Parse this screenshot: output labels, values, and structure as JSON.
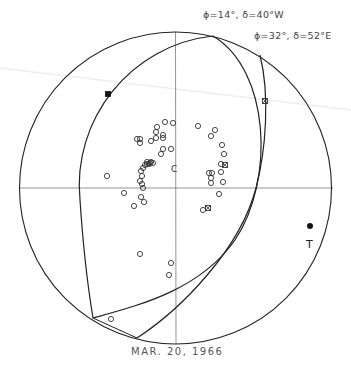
{
  "diagram": {
    "type": "stereographic-projection-focal-mechanism",
    "date_caption": "MAR. 20, 1966",
    "planes": [
      {
        "label": "ϕ=14°, δ=40°W",
        "phi": "14°",
        "delta": "40°W"
      },
      {
        "label": "ϕ=32°, δ=52°E",
        "phi": "32°",
        "delta": "52°E"
      }
    ],
    "axis_label": "T",
    "center_label": "C",
    "colors": {
      "line": "#222222",
      "axis": "#777777",
      "marker": "#333333",
      "background": "#ffffff"
    }
  },
  "chart_data": {
    "type": "scatter",
    "title": "MAR. 20, 1966",
    "primitive_circle": {
      "cx": 175.5,
      "cy": 188,
      "r": 156
    },
    "annotations": [
      "ϕ=14°, δ=40°W",
      "ϕ=32°, δ=52°E",
      "T",
      "C"
    ],
    "series": [
      {
        "name": "open-circles",
        "marker": "open-circle",
        "points": [
          [
            165,
            122
          ],
          [
            173,
            123
          ],
          [
            157,
            127
          ],
          [
            156,
            132
          ],
          [
            163,
            135
          ],
          [
            163,
            138
          ],
          [
            156,
            138
          ],
          [
            137,
            139
          ],
          [
            140,
            139
          ],
          [
            140,
            143
          ],
          [
            151,
            141
          ],
          [
            163,
            149
          ],
          [
            161,
            154
          ],
          [
            171,
            149
          ],
          [
            147,
            162
          ],
          [
            150,
            163
          ],
          [
            151,
            162
          ],
          [
            145,
            165
          ],
          [
            147,
            164
          ],
          [
            149,
            164
          ],
          [
            153,
            163
          ],
          [
            143,
            168
          ],
          [
            141,
            171
          ],
          [
            142,
            176
          ],
          [
            140,
            181
          ],
          [
            142,
            184
          ],
          [
            143,
            188
          ],
          [
            107,
            176
          ],
          [
            124,
            193
          ],
          [
            134,
            206
          ],
          [
            141,
            197
          ],
          [
            144,
            202
          ],
          [
            140,
            254
          ],
          [
            171,
            263
          ],
          [
            169,
            275
          ],
          [
            198,
            126
          ],
          [
            215,
            130
          ],
          [
            211,
            136
          ],
          [
            222,
            145
          ],
          [
            224,
            154
          ],
          [
            221,
            164
          ],
          [
            221,
            172
          ],
          [
            209,
            173
          ],
          [
            212,
            173
          ],
          [
            211,
            178
          ],
          [
            211,
            183
          ],
          [
            223,
            182
          ],
          [
            219,
            194
          ],
          [
            203,
            210
          ],
          [
            111,
            319
          ]
        ]
      },
      {
        "name": "crossed-squares",
        "marker": "crossed-square",
        "points": [
          [
            225,
            165
          ],
          [
            265,
            101
          ],
          [
            208,
            208
          ]
        ]
      },
      {
        "name": "filled-square",
        "marker": "filled-square",
        "points": [
          [
            108,
            94
          ]
        ]
      },
      {
        "name": "T-axis",
        "marker": "filled-circle",
        "points": [
          [
            310,
            226
          ]
        ]
      }
    ],
    "grid": false
  }
}
